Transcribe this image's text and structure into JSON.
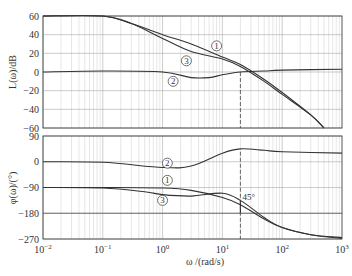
{
  "chart_data": [
    {
      "type": "line",
      "title": "",
      "xscale": "log",
      "xlabel": "ω/(rad/s)",
      "ylabel": "L(ω)/dB",
      "xlim": [
        0.01,
        1000
      ],
      "ylim": [
        -60,
        60
      ],
      "yticks": [
        60,
        40,
        20,
        0,
        -20,
        -40,
        -60
      ],
      "grid": true,
      "series": [
        {
          "name": "①",
          "x": [
            0.01,
            0.1,
            0.3,
            1,
            3,
            10,
            20,
            50,
            100,
            300,
            500
          ],
          "y": [
            60,
            60,
            52,
            40,
            30,
            16,
            8,
            -8,
            -22,
            -46,
            -60
          ]
        },
        {
          "name": "②",
          "x": [
            0.01,
            0.1,
            1,
            3,
            6,
            10,
            20,
            50,
            100,
            1000
          ],
          "y": [
            0,
            1,
            0,
            -6,
            -6,
            -3,
            0,
            1,
            2,
            3
          ]
        },
        {
          "name": "③",
          "x": [
            0.01,
            0.1,
            0.3,
            1,
            3,
            10,
            20,
            50,
            100,
            300,
            500
          ],
          "y": [
            60,
            60,
            52,
            36,
            22,
            14,
            6,
            -10,
            -24,
            -46,
            -60
          ]
        }
      ],
      "labels": [
        {
          "text": "①",
          "x": 8,
          "y": 28
        },
        {
          "text": "②",
          "x": 1.5,
          "y": -10
        },
        {
          "text": "③",
          "x": 2.5,
          "y": 12
        }
      ]
    },
    {
      "type": "line",
      "title": "",
      "xscale": "log",
      "xlabel": "ω/(rad/s)",
      "ylabel": "φ(ω)/(°)",
      "xlim": [
        0.01,
        1000
      ],
      "ylim": [
        -270,
        90
      ],
      "yticks": [
        90,
        0,
        -90,
        -180,
        -270
      ],
      "grid": true,
      "series": [
        {
          "name": "①",
          "x": [
            0.01,
            0.1,
            1,
            3,
            10,
            20,
            50,
            100,
            300,
            1000
          ],
          "y": [
            -90,
            -90,
            -92,
            -100,
            -125,
            -150,
            -200,
            -230,
            -255,
            -265
          ]
        },
        {
          "name": "②",
          "x": [
            0.01,
            0.1,
            1,
            3,
            10,
            20,
            50,
            100,
            1000
          ],
          "y": [
            0,
            -2,
            -20,
            -15,
            30,
            45,
            40,
            35,
            30
          ]
        },
        {
          "name": "③",
          "x": [
            0.01,
            0.1,
            0.5,
            1,
            3,
            10,
            20,
            50,
            100,
            300,
            1000
          ],
          "y": [
            -90,
            -92,
            -105,
            -115,
            -120,
            -110,
            -135,
            -195,
            -230,
            -255,
            -268
          ]
        }
      ],
      "reference_lines": [
        {
          "y": -180,
          "label": ""
        }
      ],
      "annotations": [
        {
          "text": "45°",
          "x": 20,
          "y": -140
        },
        {
          "type": "vline_dashed",
          "x": 20
        }
      ],
      "labels": [
        {
          "text": "①",
          "x": 1.2,
          "y": -65
        },
        {
          "text": "②",
          "x": 1.2,
          "y": -5
        },
        {
          "text": "③",
          "x": 1.0,
          "y": -135
        }
      ]
    }
  ],
  "axes": {
    "mag": {
      "ylabel": "L(ω)/dB",
      "ticks": [
        "60",
        "40",
        "20",
        "0",
        "-20",
        "-40",
        "-60"
      ]
    },
    "phase": {
      "ylabel": "φ(ω)/(°)",
      "ticks": [
        "90",
        "0",
        "-90",
        "-180",
        "-270"
      ]
    },
    "x": {
      "label": "ω /(rad/s)",
      "ticks": [
        "-2",
        "-1",
        "0",
        "1",
        "2",
        "3"
      ],
      "base": "10"
    }
  },
  "annotation_45": "45°"
}
